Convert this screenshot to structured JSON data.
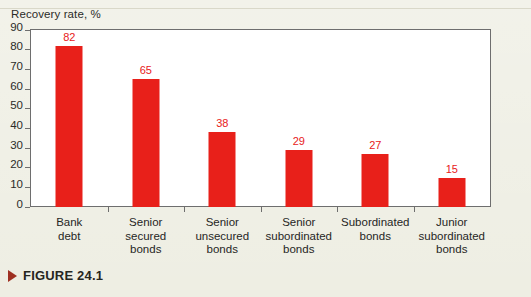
{
  "figure": {
    "marker_icon": "triangle-right-icon",
    "caption": "FIGURE 24.1"
  },
  "chart": {
    "axis_title": "Recovery rate, %",
    "bar_color": "#e8201a",
    "value_label_color": "#e8201a",
    "plot_background": "#ffffff",
    "page_background": "#eeeee3"
  },
  "chart_data": {
    "type": "bar",
    "title": "Recovery rate, %",
    "xlabel": "",
    "ylabel": "Recovery rate, %",
    "ylim": [
      0,
      90
    ],
    "yticks": [
      0,
      10,
      20,
      30,
      40,
      50,
      60,
      70,
      80,
      90
    ],
    "grid": false,
    "legend": null,
    "categories": [
      "Bank debt",
      "Senior secured bonds",
      "Senior unsecured bonds",
      "Senior subordinated bonds",
      "Subordinated bonds",
      "Junior subordinated bonds"
    ],
    "category_lines": [
      [
        "Bank",
        "debt"
      ],
      [
        "Senior",
        "secured",
        "bonds"
      ],
      [
        "Senior",
        "unsecured",
        "bonds"
      ],
      [
        "Senior",
        "subordinated",
        "bonds"
      ],
      [
        "Subordinated",
        "bonds"
      ],
      [
        "Junior",
        "subordinated",
        "bonds"
      ]
    ],
    "values": [
      82,
      65,
      38,
      29,
      27,
      15
    ]
  }
}
